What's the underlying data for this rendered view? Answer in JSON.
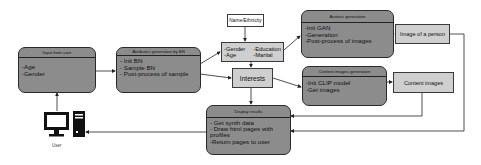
{
  "nodes": {
    "input_from_user": {
      "title": "Input from user",
      "items": [
        "-Age",
        "-Gender"
      ]
    },
    "attributes_generation": {
      "title": "Attributes generation by BN",
      "items": [
        "- Init BN",
        "- Sample BN",
        "- Post-process of sample"
      ]
    },
    "name_ethnicity": {
      "label": "Name/Ethnicity"
    },
    "attributes_list": {
      "col1": [
        "-Gender",
        "-Age"
      ],
      "col2": [
        "-Education",
        "-Marital"
      ]
    },
    "interests": {
      "label": "Interests"
    },
    "avatars_generation": {
      "title": "Avatars generation",
      "items": [
        "-Init GAN",
        "-Generation",
        "-Post-process of images"
      ]
    },
    "image_of_person": {
      "label": "Image of a person"
    },
    "content_images_generation": {
      "title": "Content images generation",
      "items": [
        "-Init CLIP model",
        "-Get images"
      ]
    },
    "content_images": {
      "label": "Content images"
    },
    "display_results": {
      "title": "Display results",
      "items": [
        "- Get synth data",
        "- Draw html pages with profiles",
        "-Return pages to user"
      ]
    },
    "user": {
      "label": "User",
      "icon": "computer-icon"
    }
  },
  "colors": {
    "rounded_fill": "#8c8c8c",
    "square_fill": "#cfcfcf",
    "stroke": "#2a2a2a",
    "background": "#ffffff"
  }
}
